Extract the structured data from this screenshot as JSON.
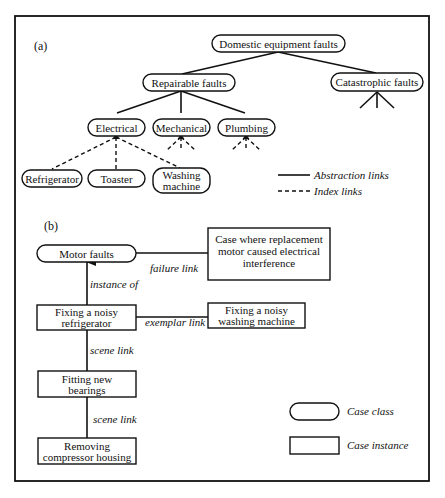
{
  "panel_a": {
    "label": "(a)",
    "nodes": {
      "root": "Domestic equipment faults",
      "repairable": "Repairable faults",
      "catastrophic": "Catastrophic faults",
      "electrical": "Electrical",
      "mechanical": "Mechanical",
      "plumbing": "Plumbing",
      "refrigerator": "Refrigerator",
      "toaster": "Toaster",
      "washing_line1": "Washing",
      "washing_line2": "machine"
    },
    "legend": {
      "abstraction": "Abstraction links",
      "index": "Index links"
    }
  },
  "panel_b": {
    "label": "(b)",
    "nodes": {
      "motor_faults": "Motor faults",
      "case_line1": "Case where replacement",
      "case_line2": "motor caused electrical",
      "case_line3": "interference",
      "fix_fridge_line1": "Fixing a noisy",
      "fix_fridge_line2": "refrigerator",
      "fix_washer_line1": "Fixing a noisy",
      "fix_washer_line2": "washing machine",
      "bearings_line1": "Fitting new",
      "bearings_line2": "bearings",
      "removing_line1": "Removing",
      "removing_line2": "compressor housing"
    },
    "links": {
      "failure": "failure link",
      "instance_of": "instance of",
      "exemplar": "exemplar link",
      "scene1": "scene link",
      "scene2": "scene link"
    },
    "legend": {
      "case_class": "Case class",
      "case_instance": "Case instance"
    }
  }
}
